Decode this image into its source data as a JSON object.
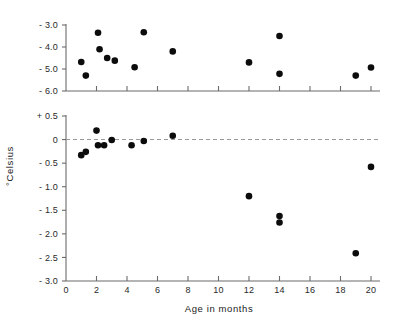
{
  "figure": {
    "background": "#ffffff",
    "point_color": "#0c0c0c",
    "axis_color": "#6b6b6b",
    "zeroline_color": "#9a9a9a"
  },
  "axis_titles": {
    "x": "Age in months",
    "y": "°Celsius"
  },
  "chart_data": {
    "type": "scatter",
    "title": "",
    "xlabel": "Age in months",
    "ylabel": "°Celsius",
    "grid": false,
    "legend": null,
    "panels": [
      {
        "name": "upper-panel",
        "ylim": [
          -6.0,
          -3.0
        ],
        "yticks": [
          -3.0,
          -4.0,
          -5.0,
          -6.0
        ],
        "ytick_labels": [
          "- 3.0",
          "- 4.0",
          "- 5.0",
          "- 6.0"
        ],
        "xlim": [
          0,
          20.5
        ],
        "xticks": [
          0,
          2,
          4,
          6,
          8,
          10,
          12,
          14,
          16,
          18,
          20
        ],
        "xtick_labels_shown": false,
        "zero_reference_line": false,
        "points": [
          {
            "x": 1.0,
            "y": -4.68
          },
          {
            "x": 1.3,
            "y": -5.3
          },
          {
            "x": 2.1,
            "y": -3.35
          },
          {
            "x": 2.2,
            "y": -4.1
          },
          {
            "x": 2.7,
            "y": -4.5
          },
          {
            "x": 3.2,
            "y": -4.62
          },
          {
            "x": 4.5,
            "y": -4.92
          },
          {
            "x": 5.1,
            "y": -3.33
          },
          {
            "x": 7.0,
            "y": -4.2
          },
          {
            "x": 12.0,
            "y": -4.7
          },
          {
            "x": 14.0,
            "y": -3.5
          },
          {
            "x": 14.0,
            "y": -5.22
          },
          {
            "x": 19.0,
            "y": -5.3
          },
          {
            "x": 20.0,
            "y": -4.93
          }
        ]
      },
      {
        "name": "lower-panel",
        "ylim": [
          -3.0,
          0.5
        ],
        "yticks": [
          0.5,
          0.0,
          -0.5,
          -1.0,
          -1.5,
          -2.0,
          -2.5,
          -3.0
        ],
        "ytick_labels": [
          "+ 0.5",
          "0",
          "- 0.5",
          "- 1.0",
          "- 1.5",
          "- 2.0",
          "- 2.5",
          "- 3.0"
        ],
        "xlim": [
          0,
          20.5
        ],
        "xticks": [
          0,
          2,
          4,
          6,
          8,
          10,
          12,
          14,
          16,
          18,
          20
        ],
        "xtick_labels": [
          "0",
          "2",
          "4",
          "6",
          "8",
          "10",
          "12",
          "14",
          "16",
          "18",
          "20"
        ],
        "zero_reference_line": true,
        "points": [
          {
            "x": 1.0,
            "y": -0.33
          },
          {
            "x": 1.3,
            "y": -0.26
          },
          {
            "x": 2.0,
            "y": 0.19
          },
          {
            "x": 2.1,
            "y": -0.12
          },
          {
            "x": 2.5,
            "y": -0.12
          },
          {
            "x": 3.0,
            "y": -0.01
          },
          {
            "x": 4.3,
            "y": -0.12
          },
          {
            "x": 5.1,
            "y": -0.03
          },
          {
            "x": 7.0,
            "y": 0.08
          },
          {
            "x": 12.0,
            "y": -1.2
          },
          {
            "x": 14.0,
            "y": -1.62
          },
          {
            "x": 14.0,
            "y": -1.76
          },
          {
            "x": 19.0,
            "y": -2.41
          },
          {
            "x": 20.0,
            "y": -0.58
          }
        ]
      }
    ]
  }
}
